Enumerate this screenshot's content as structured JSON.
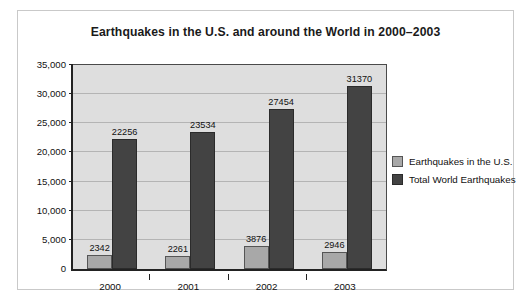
{
  "chart_data": {
    "type": "bar",
    "title": "Earthquakes in the U.S. and around the World in 2000–2003",
    "xlabel": "",
    "ylabel": "",
    "categories": [
      "2000",
      "2001",
      "2002",
      "2003"
    ],
    "series": [
      {
        "name": "Earthquakes in the U.S.",
        "color": "#a8a8a8",
        "values": [
          2342,
          2261,
          3876,
          2946
        ],
        "labels": [
          "2342",
          "2261",
          "3876",
          "2946"
        ]
      },
      {
        "name": "Total World Earthquakes",
        "color": "#434343",
        "values": [
          22256,
          23534,
          27454,
          31370
        ],
        "labels": [
          "22256",
          "23534",
          "27454",
          "31370"
        ]
      }
    ],
    "ylim": [
      0,
      35000
    ],
    "yticks": [
      0,
      5000,
      10000,
      15000,
      20000,
      25000,
      30000,
      35000
    ],
    "ytick_labels": [
      "0",
      "5,000",
      "10,000",
      "15,000",
      "20,000",
      "25,000",
      "30,000",
      "35,000"
    ],
    "grid": true,
    "legend_position": "right",
    "plot_background": "#dedede",
    "gridline_color": "#b4b4b4",
    "axis_color": "#222222"
  },
  "legend": {
    "entries": [
      {
        "label": "Earthquakes in the U.S."
      },
      {
        "label": "Total World Earthquakes"
      }
    ]
  }
}
